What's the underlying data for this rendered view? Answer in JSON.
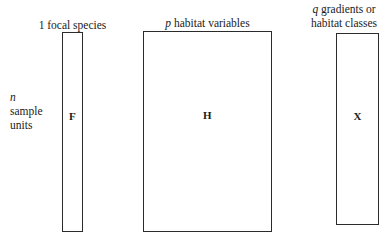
{
  "figure": {
    "background_color": "#ffffff",
    "line_color": "#2b2b2b",
    "text_color": "#1a1a1a"
  },
  "matrices": {
    "f": {
      "letter": "F",
      "column_label_symbol": "1",
      "column_label_text": "focal species",
      "row_label_symbol": "n",
      "row_label_line1": "sample",
      "row_label_line2": "units"
    },
    "h": {
      "letter": "H",
      "column_label_symbol": "p",
      "column_label_text": "habitat variables"
    },
    "x": {
      "letter": "X",
      "column_label_symbol": "q",
      "column_label_line1": "gradients or",
      "column_label_line2": "habitat classes"
    }
  },
  "chart_data": {
    "type": "diagram",
    "title": "",
    "elements": [
      {
        "name": "F",
        "rows_label": "n sample units",
        "columns_label": "1 focal species",
        "rows_symbol": "n",
        "columns_symbol": "1",
        "shape": "rectangle",
        "relative_width": "narrow"
      },
      {
        "name": "H",
        "rows_label": "n sample units",
        "columns_label": "p habitat variables",
        "rows_symbol": "n",
        "columns_symbol": "p",
        "shape": "rectangle",
        "relative_width": "wide"
      },
      {
        "name": "X",
        "rows_label": "n sample units",
        "columns_label": "q gradients or habitat classes",
        "rows_symbol": "n",
        "columns_symbol": "q",
        "shape": "rectangle",
        "relative_width": "medium"
      }
    ]
  }
}
